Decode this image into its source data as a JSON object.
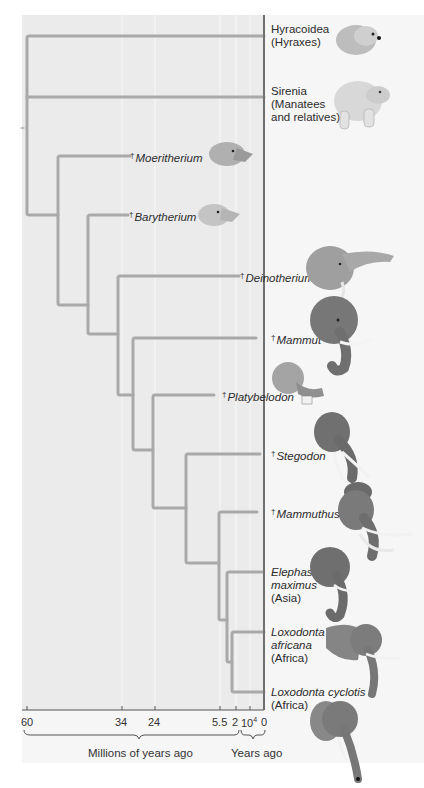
{
  "diagram": {
    "type": "phylogenetic-tree",
    "panel_color": "#ebebeb",
    "branch_color": "#a9a9a9",
    "taxa": [
      {
        "id": "hyracoidea",
        "line1": "Hyracoidea",
        "line2": "(Hyraxes)",
        "line3": "",
        "extinct": false,
        "italic": false
      },
      {
        "id": "sirenia",
        "line1": "Sirenia",
        "line2": "(Manatees",
        "line3": "and relatives)",
        "extinct": false,
        "italic": false
      },
      {
        "id": "moeritherium",
        "line1": "Moeritherium",
        "extinct": true,
        "italic": true
      },
      {
        "id": "barytherium",
        "line1": "Barytherium",
        "extinct": true,
        "italic": true
      },
      {
        "id": "deinotherium",
        "line1": "Deinotherium",
        "extinct": true,
        "italic": true
      },
      {
        "id": "mammut",
        "line1": "Mammut",
        "extinct": true,
        "italic": true
      },
      {
        "id": "platybelodon",
        "line1": "Platybelodon",
        "extinct": true,
        "italic": true
      },
      {
        "id": "stegodon",
        "line1": "Stegodon",
        "extinct": true,
        "italic": true
      },
      {
        "id": "mammuthus",
        "line1": "Mammuthus",
        "extinct": true,
        "italic": true
      },
      {
        "id": "elephas",
        "line1": "Elephas",
        "line2": "maximus",
        "line3": "(Asia)",
        "extinct": false,
        "italic": true
      },
      {
        "id": "loxodonta-africana",
        "line1": "Loxodonta",
        "line2": "africana",
        "line3": "(Africa)",
        "extinct": false,
        "italic": true
      },
      {
        "id": "loxodonta-cyclotis",
        "line1": "Loxodonta cyclotis",
        "line2": "(Africa)",
        "extinct": false,
        "italic": true
      }
    ],
    "extinct_marker": "†"
  },
  "axis": {
    "ticks": [
      "60",
      "34",
      "24",
      "5.5",
      "2",
      "10",
      "0"
    ],
    "tick_10_superscript": "4",
    "millions_caption": "Millions of years ago",
    "years_caption": "Years ago"
  }
}
